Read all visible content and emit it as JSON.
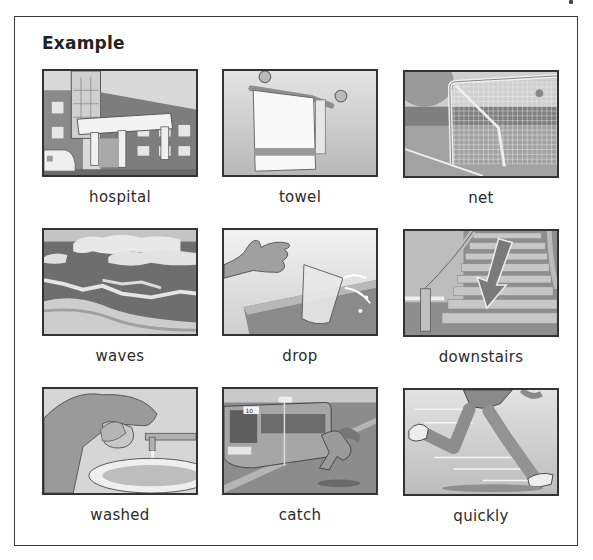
{
  "heading": "Example",
  "items": [
    {
      "label": "hospital",
      "icon": "hospital-icon"
    },
    {
      "label": "towel",
      "icon": "towel-icon"
    },
    {
      "label": "net",
      "icon": "goal-net-icon"
    },
    {
      "label": "waves",
      "icon": "waves-icon"
    },
    {
      "label": "drop",
      "icon": "dropping-glass-icon"
    },
    {
      "label": "downstairs",
      "icon": "staircase-arrow-icon"
    },
    {
      "label": "washed",
      "icon": "washing-face-icon"
    },
    {
      "label": "catch",
      "icon": "catching-bus-icon"
    },
    {
      "label": "quickly",
      "icon": "running-legs-icon"
    }
  ],
  "bus_number": "10",
  "colors": {
    "frame": "#3a3a3a",
    "text": "#2b2b2b",
    "paper": "#ffffff"
  }
}
